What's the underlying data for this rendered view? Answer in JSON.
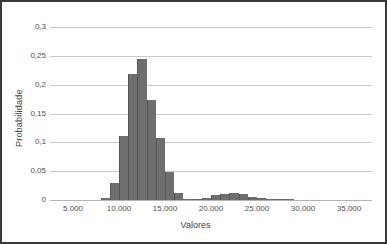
{
  "chart_data": {
    "type": "bar",
    "title": "",
    "subtitle": "",
    "xlabel": "Valores",
    "ylabel": "Probabilidade",
    "xlim": [
      2500,
      37500
    ],
    "ylim": [
      0,
      0.3
    ],
    "grid": true,
    "legend": null,
    "legend_position": "none",
    "decimal_separator": ",",
    "thousands_separator": ".",
    "bar_color": "#6e6e6e",
    "grid_color": "#c8c8c8",
    "bin_width": 1000,
    "xticks": [
      5000,
      10000,
      15000,
      20000,
      25000,
      30000,
      35000
    ],
    "xtick_labels": [
      "5.000",
      "10.000",
      "15.000",
      "20.000",
      "25.000",
      "30.000",
      "35.000"
    ],
    "yticks": [
      0,
      0.05,
      0.1,
      0.15,
      0.2,
      0.25,
      0.3
    ],
    "ytick_labels": [
      "0",
      "0,05",
      "0,1",
      "0,15",
      "0,2",
      "0,25",
      "0,3"
    ],
    "categories": [
      "8500",
      "9500",
      "10500",
      "11500",
      "12500",
      "13500",
      "14500",
      "15500",
      "16500",
      "17500",
      "18500",
      "19500",
      "20500",
      "21500",
      "22500",
      "23500",
      "24500",
      "25500",
      "26500",
      "27500",
      "28500"
    ],
    "x": [
      8500,
      9500,
      10500,
      11500,
      12500,
      13500,
      14500,
      15500,
      16500,
      17500,
      18500,
      19500,
      20500,
      21500,
      22500,
      23500,
      24500,
      25500,
      26500,
      27500,
      28500
    ],
    "values": [
      0.003,
      0.029,
      0.111,
      0.219,
      0.245,
      0.173,
      0.107,
      0.048,
      0.013,
      0.002,
      0.001,
      0.004,
      0.009,
      0.011,
      0.012,
      0.011,
      0.006,
      0.003,
      0.002,
      0.001,
      0.0005
    ]
  }
}
